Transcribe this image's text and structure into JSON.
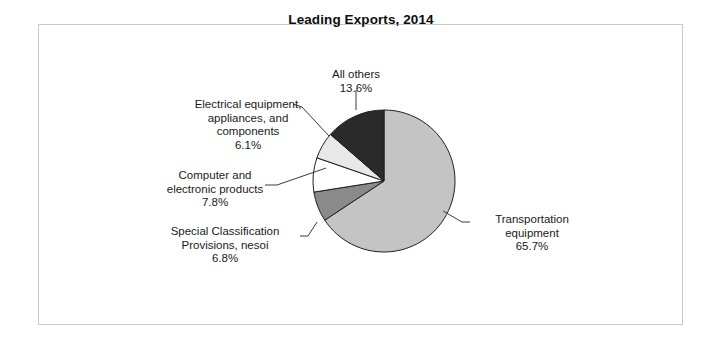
{
  "figure": {
    "title": "Leading Exports, 2014",
    "frame_color": "#c9c9c9",
    "background": "#ffffff"
  },
  "chart_data": {
    "type": "pie",
    "title": "Leading Exports, 2014",
    "xlabel": "",
    "ylabel": "",
    "legend_position": "none",
    "grid": false,
    "units": "percent",
    "start_angle_deg": 90,
    "direction": "clockwise",
    "categories": [
      "Transportation equipment",
      "Special Classification Provisions, nesoi",
      "Computer and electronic products",
      "Electrical equipment, appliances, and components",
      "All others"
    ],
    "values": [
      65.7,
      6.8,
      7.8,
      6.1,
      13.6
    ],
    "colors": [
      "#c4c4c4",
      "#8a8a8a",
      "#ffffff",
      "#e8e8e8",
      "#2a2a2a"
    ],
    "slices": [
      {
        "name": "Transportation equipment",
        "label_line1": "Transportation",
        "label_line2": "equipment",
        "percent_label": "65.7%",
        "value": 65.7,
        "color": "#c4c4c4"
      },
      {
        "name": "Special Classification Provisions, nesoi",
        "label_line1": "Special Classification",
        "label_line2": "Provisions, nesoi",
        "percent_label": "6.8%",
        "value": 6.8,
        "color": "#8a8a8a"
      },
      {
        "name": "Computer and electronic products",
        "label_line1": "Computer and",
        "label_line2": "electronic products",
        "percent_label": "7.8%",
        "value": 7.8,
        "color": "#ffffff"
      },
      {
        "name": "Electrical equipment, appliances, and components",
        "label_line1": "Electrical equipment,",
        "label_line2": "appliances, and",
        "label_line3": "components",
        "percent_label": "6.1%",
        "value": 6.1,
        "color": "#e8e8e8"
      },
      {
        "name": "All others",
        "label_line1": "All others",
        "percent_label": "13.6%",
        "value": 13.6,
        "color": "#2a2a2a"
      }
    ]
  },
  "labels": {
    "all_others": "All others\n13.6%",
    "electrical": "Electrical equipment,\nappliances, and\ncomponents\n6.1%",
    "computer": "Computer and\nelectronic products\n7.8%",
    "special": "Special Classification\nProvisions, nesoi\n6.8%",
    "transportation": "Transportation\nequipment\n65.7%"
  }
}
